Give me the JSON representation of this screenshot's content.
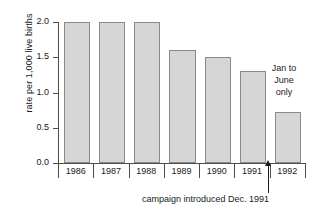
{
  "chart_data": {
    "type": "bar",
    "title": "",
    "xlabel": "",
    "ylabel": "rate per 1,000 live births",
    "categories": [
      "1986",
      "1987",
      "1988",
      "1989",
      "1990",
      "1991",
      "1992"
    ],
    "values": [
      2.0,
      2.0,
      2.0,
      1.6,
      1.5,
      1.3,
      0.72
    ],
    "ylim": [
      0.0,
      2.0
    ],
    "yticks": [
      "0.0",
      "0.5",
      "1.0",
      "1.5",
      "2.0"
    ],
    "ytick_values": [
      0.0,
      0.5,
      1.0,
      1.5,
      2.0
    ],
    "grid": false,
    "legend": false,
    "annotations": [
      {
        "name": "jan-to-june-only",
        "lines": [
          "Jan to",
          "June",
          "only"
        ],
        "target_category": "1992"
      },
      {
        "name": "campaign-introduced",
        "text": "campaign introduced Dec. 1991",
        "marker": "up-arrow",
        "target_between": [
          "1991",
          "1992"
        ]
      }
    ],
    "colors": {
      "bar_fill": "#d6d6d6",
      "bar_border": "#8a8a8a",
      "axis": "#4d4d4d",
      "text": "#1a1a1a",
      "background": "#ffffff"
    }
  }
}
